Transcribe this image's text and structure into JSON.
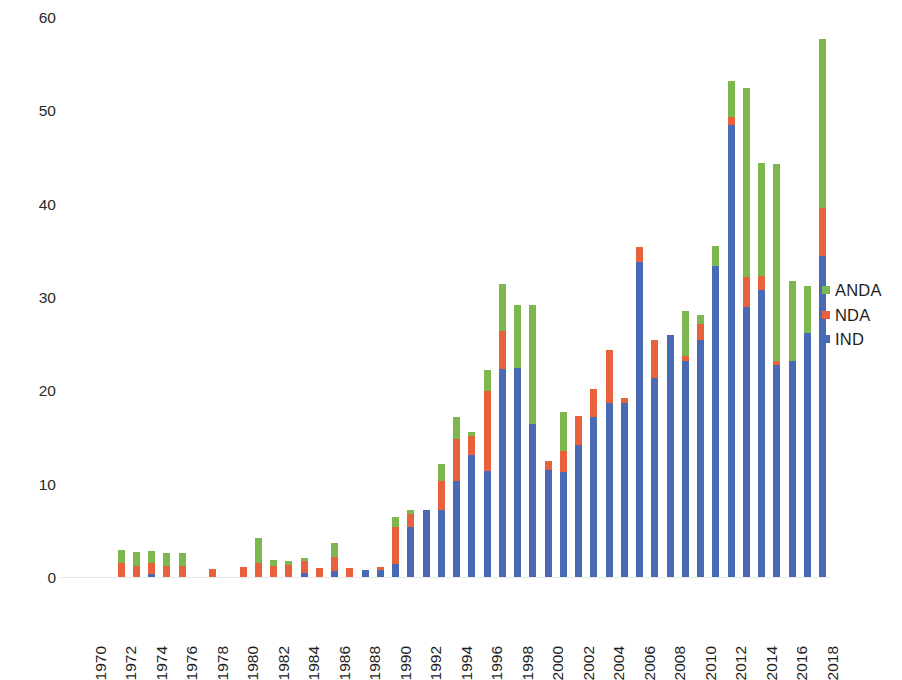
{
  "chart_data": {
    "type": "bar",
    "subtype": "stacked-bar",
    "title": "",
    "subtitle": "",
    "xlabel": "",
    "ylabel": "",
    "grid": false,
    "legend_position": "right",
    "ylim": [
      0,
      60
    ],
    "yticks": [
      0,
      10,
      20,
      30,
      40,
      50,
      60
    ],
    "ytick_labels": [
      "0",
      "10",
      "20",
      "30",
      "40",
      "50",
      "60"
    ],
    "xtick_labels": [
      "1970",
      "1972",
      "1974",
      "1976",
      "1978",
      "1980",
      "1982",
      "1984",
      "1986",
      "1988",
      "1990",
      "1992",
      "1994",
      "1996",
      "1998",
      "2000",
      "2002",
      "2004",
      "2006",
      "2008",
      "2010",
      "2012",
      "2014",
      "2016",
      "2018"
    ],
    "x": [
      1970,
      1971,
      1972,
      1973,
      1974,
      1975,
      1976,
      1977,
      1978,
      1979,
      1980,
      1981,
      1982,
      1983,
      1984,
      1985,
      1986,
      1987,
      1988,
      1989,
      1990,
      1991,
      1992,
      1993,
      1994,
      1995,
      1996,
      1997,
      1998,
      1999,
      2000,
      2001,
      2002,
      2003,
      2004,
      2005,
      2006,
      2007,
      2008,
      2009,
      2010,
      2011,
      2012,
      2013,
      2014,
      2015,
      2016,
      2017,
      2018,
      2019
    ],
    "series": [
      {
        "name": "IND",
        "color": "#4a69b5",
        "values": [
          0,
          0,
          0,
          0,
          0.4,
          0,
          0,
          0,
          0,
          0,
          0,
          0,
          0,
          0,
          0.5,
          0,
          0.8,
          0,
          0.9,
          0.9,
          1.5,
          5.5,
          7.3,
          7.3,
          10.4,
          13.2,
          11.5,
          22.4,
          22.5,
          16.5,
          11.6,
          11.4,
          14.2,
          17.3,
          18.8,
          18.7,
          33.9,
          21.4,
          26,
          23.3,
          25.5,
          33.4,
          48.5,
          29,
          30.9,
          22.8,
          23.3,
          26.3,
          34.5,
          0
        ]
      },
      {
        "name": "NDA",
        "color": "#e8613c",
        "values": [
          0,
          0,
          1.6,
          1.3,
          1.2,
          1.3,
          1.3,
          0,
          1,
          0,
          1.2,
          1.6,
          1.3,
          1.4,
          1.3,
          1.1,
          1.5,
          1.1,
          0,
          0.3,
          4,
          1.4,
          0,
          3.1,
          4.5,
          2,
          8.5,
          4.1,
          0,
          0,
          0.9,
          2.2,
          3.2,
          3,
          5.6,
          0.6,
          1.6,
          4.1,
          0,
          0.5,
          1.7,
          0,
          0.9,
          3.3,
          1.5,
          0.4,
          0,
          0,
          5.1,
          0
        ]
      },
      {
        "name": "ANDA",
        "color": "#7cb84f",
        "values": [
          0,
          0,
          1.4,
          1.5,
          1.3,
          1.4,
          1.4,
          0,
          0,
          0,
          0,
          2.7,
          0.6,
          0.4,
          0.4,
          0,
          1.4,
          0,
          0,
          0,
          1,
          0.4,
          0,
          1.8,
          2.4,
          0.4,
          2.3,
          5,
          6.8,
          12.8,
          0,
          4.2,
          0,
          0,
          0,
          0,
          0,
          0,
          0,
          4.8,
          1,
          2.2,
          3.9,
          20.2,
          12.1,
          21.2,
          8.5,
          5,
          18.1,
          0
        ]
      }
    ],
    "totals": [
      0,
      0,
      3,
      2.8,
      2.9,
      2.7,
      2.7,
      0,
      1,
      0,
      1.2,
      4.3,
      1.9,
      1.8,
      2.2,
      1.1,
      3.7,
      1.1,
      0.9,
      1.2,
      6.5,
      7.3,
      7.3,
      12.2,
      17.3,
      15.6,
      22.3,
      31.5,
      29.3,
      29.3,
      12.5,
      17.8,
      17.4,
      20.3,
      24.4,
      19.3,
      35.5,
      25.5,
      26,
      28.6,
      28.2,
      35.6,
      53.3,
      52.5,
      44.5,
      44.4,
      31.8,
      31.3,
      57.7,
      0
    ]
  },
  "legend": {
    "items": [
      {
        "label": "ANDA",
        "color": "#7cb84f"
      },
      {
        "label": "NDA",
        "color": "#e8613c"
      },
      {
        "label": "IND",
        "color": "#4a69b5"
      }
    ]
  }
}
